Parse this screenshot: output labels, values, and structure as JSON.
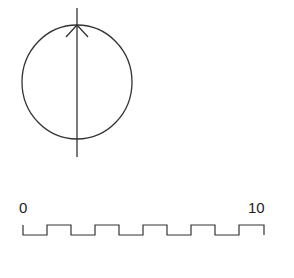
{
  "diagram": {
    "phasor": {
      "circle": {
        "cx": 77,
        "cy": 82,
        "rx": 55,
        "ry": 57
      },
      "axis_line": {
        "x": 77,
        "y1": 8,
        "y2": 157
      },
      "arrow": {
        "tip_x": 77,
        "tip_y": 25,
        "wing_left": [
          66,
          37
        ],
        "wing_right": [
          88,
          37
        ]
      }
    },
    "waveform": {
      "type": "square-wave",
      "label_start": "0",
      "label_end": "10",
      "high_y": 225,
      "low_y": 235,
      "x_start": 23,
      "x_end": 264,
      "cycles": 5
    },
    "stroke_color": "#333333"
  }
}
